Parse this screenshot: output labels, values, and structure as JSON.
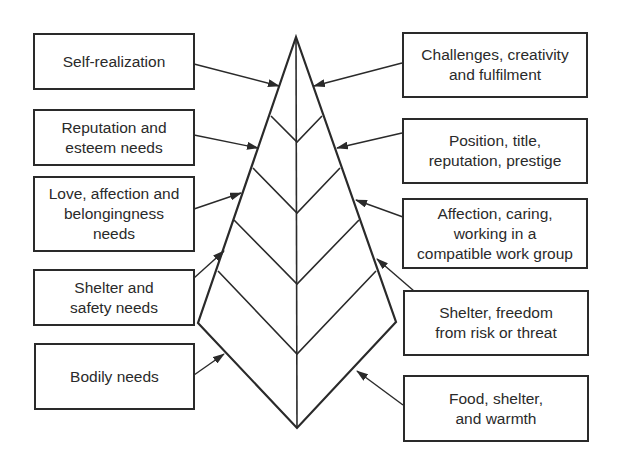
{
  "diagram": {
    "type": "needs-hierarchy-kite",
    "left_labels": [
      {
        "id": "self-realization",
        "text": "Self-realization",
        "level": 1
      },
      {
        "id": "reputation-esteem",
        "text": "Reputation and\nesteem needs",
        "level": 2
      },
      {
        "id": "love-affection",
        "text": "Love, affection and\nbelongingness\nneeds",
        "level": 3
      },
      {
        "id": "shelter-safety",
        "text": "Shelter and\nsafety needs",
        "level": 4
      },
      {
        "id": "bodily-needs",
        "text": "Bodily needs",
        "level": 5
      }
    ],
    "right_labels": [
      {
        "id": "challenges",
        "text": "Challenges, creativity\nand fulfilment",
        "level": 1
      },
      {
        "id": "position",
        "text": "Position, title,\nreputation, prestige",
        "level": 2
      },
      {
        "id": "affection-caring",
        "text": "Affection, caring,\nworking in a\ncompatible work group",
        "level": 3
      },
      {
        "id": "shelter-freedom",
        "text": "Shelter, freedom\nfrom risk or threat",
        "level": 4
      },
      {
        "id": "food-shelter",
        "text": "Food, shelter,\nand warmth",
        "level": 5
      }
    ],
    "colors": {
      "stroke": "#2a2a2a",
      "background": "#ffffff",
      "text": "#2a2a2a"
    }
  }
}
